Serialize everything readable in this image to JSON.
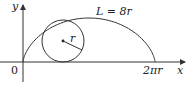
{
  "figure": {
    "axes": {
      "x_label": "x",
      "y_label": "y",
      "origin_label": "0"
    },
    "x_tick_label": "2πr",
    "arc_length_label": "L = 8r",
    "radius_label": "r",
    "curve": "cycloid",
    "colors": {
      "stroke": "#333333",
      "background": "#ffffff"
    }
  }
}
